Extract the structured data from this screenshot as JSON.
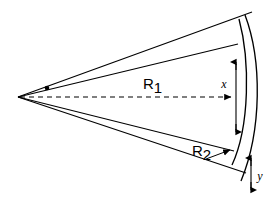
{
  "figure": {
    "type": "technical-line-diagram",
    "title": "",
    "background_color": "#ffffff",
    "line_color": "#000000",
    "width": 273,
    "height": 200
  },
  "labels": {
    "r1": {
      "base": "R",
      "sub": "1",
      "full": "R₁"
    },
    "r2": {
      "base": "R",
      "sub": "2",
      "full": "R₂"
    },
    "x": "x",
    "y": "y"
  },
  "geometry": {
    "apex": {
      "x": 18,
      "y": 97
    },
    "rays": [
      {
        "name": "upper-outer-ray",
        "from": [
          18,
          97
        ],
        "to": [
          252,
          12
        ]
      },
      {
        "name": "upper-inner-ray",
        "from": [
          18,
          97
        ],
        "to": [
          238,
          44
        ]
      },
      {
        "name": "lower-inner-ray",
        "from": [
          18,
          97
        ],
        "to": [
          234,
          151
        ]
      },
      {
        "name": "lower-outer-ray",
        "from": [
          18,
          97
        ],
        "to": [
          246,
          173
        ]
      }
    ],
    "centerline": {
      "name": "axis-dashed",
      "from": [
        18,
        97
      ],
      "to": [
        239,
        97
      ],
      "style": "dashed",
      "arrowhead": "right"
    },
    "arcs": [
      {
        "name": "inner-arc",
        "top": [
          238,
          20
        ],
        "bottom": [
          231,
          164
        ],
        "bulge": 13
      },
      {
        "name": "outer-arc",
        "top": [
          243,
          16
        ],
        "bottom": [
          240,
          180
        ],
        "bulge": 18
      }
    ],
    "apex_marker_dot": {
      "x": 47,
      "y": 88,
      "r": 2.2
    },
    "dim_x": {
      "line_x": 236,
      "top": 62,
      "bottom": 132,
      "label_pos": [
        228,
        84
      ]
    },
    "dim_y": {
      "line_x": 253,
      "top": 158,
      "bottom": 189,
      "label_pos": [
        261,
        178
      ]
    },
    "r2_leader": {
      "from": [
        208,
        158
      ],
      "to": [
        234,
        150
      ]
    }
  }
}
